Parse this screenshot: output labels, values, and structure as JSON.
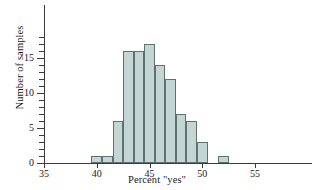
{
  "chart_data": {
    "type": "bar",
    "title": "",
    "subtitle": "",
    "xlabel": "Percent \"yes\"",
    "ylabel": "Number of samples",
    "bin_width": 1,
    "grid": false,
    "legend": null,
    "xlim": [
      35,
      58
    ],
    "ylim": [
      0,
      18
    ],
    "xticks": [
      35,
      40,
      45,
      50,
      55
    ],
    "yticks": [
      0,
      5,
      10,
      15
    ],
    "y_minor_tick_step": 1,
    "categories": [
      40,
      41,
      42,
      43,
      44,
      45,
      46,
      47,
      48,
      49,
      50,
      51,
      52
    ],
    "values": [
      1,
      1,
      6,
      16,
      16,
      17,
      14,
      12,
      7,
      6,
      3,
      0,
      1
    ],
    "bins": [
      {
        "center": 40,
        "left": 39.5,
        "right": 40.5,
        "count": 1
      },
      {
        "center": 41,
        "left": 40.5,
        "right": 41.5,
        "count": 1
      },
      {
        "center": 42,
        "left": 41.5,
        "right": 42.5,
        "count": 6
      },
      {
        "center": 43,
        "left": 42.5,
        "right": 43.5,
        "count": 16
      },
      {
        "center": 44,
        "left": 43.5,
        "right": 44.5,
        "count": 16
      },
      {
        "center": 45,
        "left": 44.5,
        "right": 45.5,
        "count": 17
      },
      {
        "center": 46,
        "left": 45.5,
        "right": 46.5,
        "count": 14
      },
      {
        "center": 47,
        "left": 46.5,
        "right": 47.5,
        "count": 12
      },
      {
        "center": 48,
        "left": 47.5,
        "right": 48.5,
        "count": 7
      },
      {
        "center": 49,
        "left": 48.5,
        "right": 49.5,
        "count": 6
      },
      {
        "center": 50,
        "left": 49.5,
        "right": 50.5,
        "count": 3
      },
      {
        "center": 51,
        "left": 50.5,
        "right": 51.5,
        "count": 0
      },
      {
        "center": 52,
        "left": 51.5,
        "right": 52.5,
        "count": 1
      }
    ],
    "colors": {
      "bar_fill": "#c4d6d4",
      "bar_stroke": "#5e7370",
      "axis": "#3a3a3a",
      "text": "#1a1a1a",
      "background": "#ffffff"
    }
  }
}
